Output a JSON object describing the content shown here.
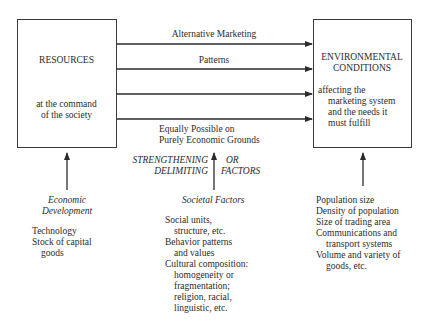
{
  "left_box": {
    "title": "RESOURCES",
    "subtitle_line1": "at the command",
    "subtitle_line2": "of the society"
  },
  "right_box": {
    "title_line1": "ENVIRONMENTAL",
    "title_line2": "CONDITIONS",
    "desc_line1": "affecting the",
    "desc_line2": "marketing system",
    "desc_line3": "and the needs it",
    "desc_line4": "must fulfill"
  },
  "flow_labels": {
    "top1": "Alternative Marketing",
    "top2": "Patterns",
    "bottom1": "Equally Possible on",
    "bottom2": "Purely Economic Grounds"
  },
  "strengthening": {
    "left1": "STRENGTHENING",
    "left2": "DELIMITING",
    "right1": "OR",
    "right2": "FACTORS"
  },
  "economic_development": {
    "heading1": "Economic",
    "heading2": "Development",
    "items": [
      "Technology",
      "Stock of capital",
      "goods"
    ]
  },
  "societal_factors": {
    "heading": "Societal Factors",
    "items": [
      "Social units,",
      "structure, etc.",
      "Behavior patterns",
      "and values",
      "Cultural composition:",
      "homogeneity or",
      "fragmentation;",
      "religion, racial,",
      "linguistic, etc."
    ]
  },
  "environmental_factors": {
    "items": [
      "Population size",
      "Density of population",
      "Size of trading area",
      "Communications and",
      "transport systems",
      "Volume and variety of",
      "goods, etc."
    ]
  }
}
